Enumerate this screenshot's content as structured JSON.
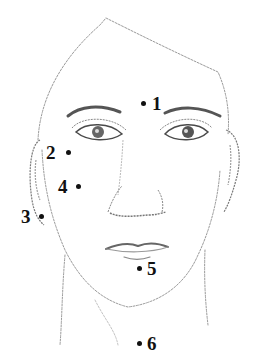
{
  "diagram": {
    "colors": {
      "ink": "#111111",
      "sketch": "#8a8a8a",
      "background": "#ffffff"
    },
    "points": [
      {
        "id": 1,
        "label": "1",
        "dot": [
          143,
          103
        ],
        "text": [
          152,
          94
        ],
        "location": "between eyebrows"
      },
      {
        "id": 2,
        "label": "2",
        "dot": [
          68,
          152
        ],
        "text": [
          46,
          143
        ],
        "location": "temple"
      },
      {
        "id": 3,
        "label": "3",
        "dot": [
          41,
          216
        ],
        "text": [
          21,
          207
        ],
        "location": "jaw angle near ear"
      },
      {
        "id": 4,
        "label": "4",
        "dot": [
          78,
          186
        ],
        "text": [
          58,
          177
        ],
        "location": "cheek"
      },
      {
        "id": 5,
        "label": "5",
        "dot": [
          139,
          268
        ],
        "text": [
          147,
          259
        ],
        "location": "below lower lip"
      },
      {
        "id": 6,
        "label": "6",
        "dot": [
          139,
          343
        ],
        "text": [
          147,
          334
        ],
        "location": "throat"
      }
    ]
  }
}
